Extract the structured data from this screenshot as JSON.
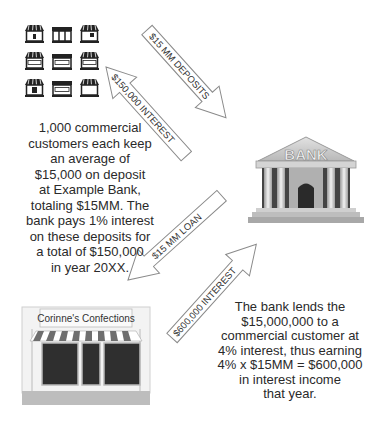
{
  "diagram": {
    "nodes": {
      "customers": {
        "label": "Commercial customers (storefront icons)",
        "store_signs": [
          "OPEN",
          "OPEN",
          "CLOSED"
        ]
      },
      "bank": {
        "label": "BANK"
      },
      "borrower": {
        "label": "Corinne's Confections"
      }
    },
    "arrows": {
      "deposits": {
        "label": "$15 MM DEPOSITS",
        "from": "customers",
        "to": "bank"
      },
      "deposit_interest": {
        "label": "$150,000 INTEREST",
        "from": "bank",
        "to": "customers"
      },
      "loan": {
        "label": "$15 MM LOAN",
        "from": "bank",
        "to": "borrower"
      },
      "loan_interest": {
        "label": "$600,000 INTEREST",
        "from": "borrower",
        "to": "bank"
      }
    },
    "left_text": {
      "lines": [
        "1,000 commercial",
        "customers each keep",
        "an average of",
        "$15,000 on deposit",
        "at Example Bank,",
        "totaling $15MM.  The",
        "bank pays 1% interest",
        "on these deposits for",
        "a total of $150,000",
        "in year 20XX."
      ]
    },
    "right_text": {
      "lines": [
        "The bank lends the",
        "$15,000,000 to a",
        "commercial customer at",
        "4% interest, thus earning",
        "4% x $15MM = $600,000",
        "in interest income",
        "that year."
      ]
    },
    "colors": {
      "arrow_stroke": "#8a8a8a",
      "text": "#2a2a2a",
      "awning_stripe": "#6e6e6e",
      "window": "#2f2f2f"
    }
  }
}
